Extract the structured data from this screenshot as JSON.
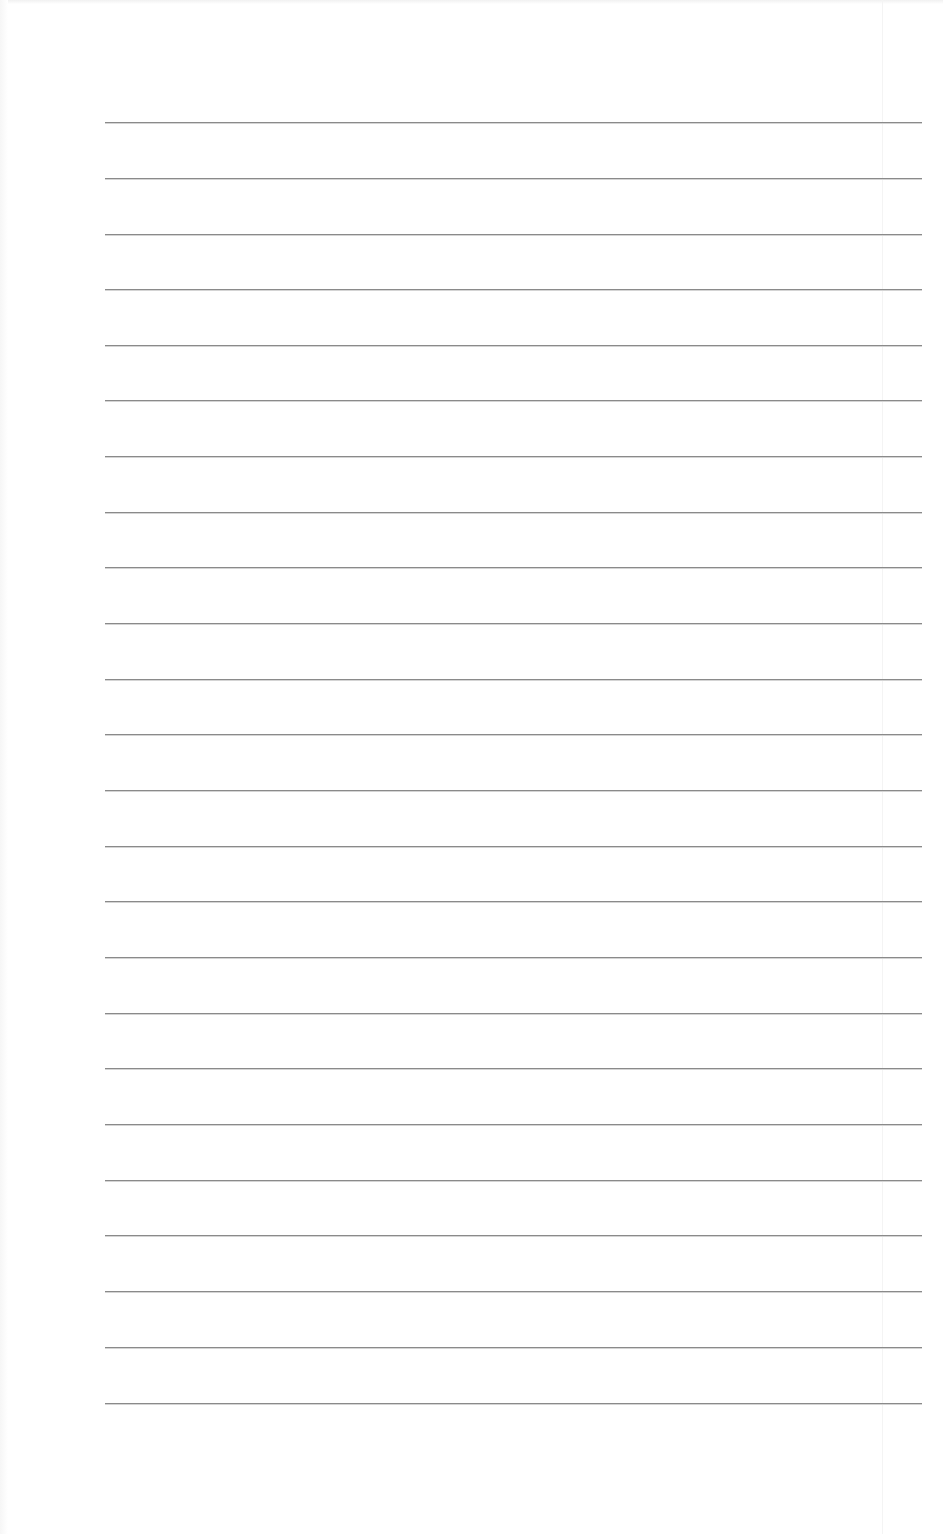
{
  "page": {
    "type": "lined-paper",
    "background_color": "#ffffff",
    "line_color": "#8a8a8a",
    "line_count": 24,
    "line_left_px": 105,
    "line_right_px": 922,
    "line_positions_y": [
      122,
      178,
      234,
      289,
      345,
      400,
      456,
      512,
      567,
      623,
      679,
      734,
      790,
      846,
      901,
      957,
      1013,
      1068,
      1124,
      1180,
      1235,
      1291,
      1347,
      1403
    ]
  }
}
